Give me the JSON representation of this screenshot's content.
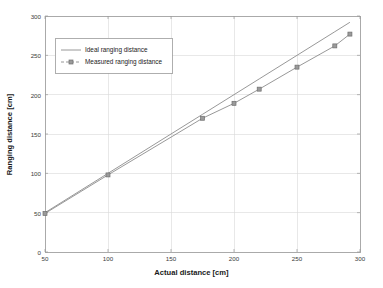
{
  "chart_data": {
    "type": "line",
    "title": "",
    "xlabel": "Actual distance [cm]",
    "ylabel": "Ranging distance [cm]",
    "xlim": [
      50,
      300
    ],
    "ylim": [
      0,
      300
    ],
    "xticks": [
      50,
      100,
      150,
      200,
      250,
      300
    ],
    "yticks": [
      0,
      50,
      100,
      150,
      200,
      250,
      300
    ],
    "grid": true,
    "legend_position": "upper-left-inside",
    "x": [
      50,
      100,
      175,
      200,
      220,
      250,
      280,
      292
    ],
    "series": [
      {
        "name": "Ideal ranging distance",
        "marker": "none",
        "color": "#8c8c8c",
        "values": [
          50,
          100,
          175,
          200,
          220,
          250,
          280,
          292
        ]
      },
      {
        "name": "Measured ranging distance",
        "marker": "square",
        "color": "#8c8c8c",
        "values": [
          49,
          98,
          170,
          189,
          207,
          235,
          262,
          277
        ]
      }
    ]
  },
  "axes": {
    "xlabel": "Actual distance [cm]",
    "ylabel": "Ranging distance [cm]",
    "xtick_labels": [
      "50",
      "100",
      "150",
      "200",
      "250",
      "300"
    ],
    "ytick_labels": [
      "0",
      "50",
      "100",
      "150",
      "200",
      "250",
      "300"
    ]
  },
  "legend": {
    "entries": [
      {
        "label": "Ideal ranging distance",
        "marker": "line"
      },
      {
        "label": "Measured ranging distance",
        "marker": "circle-line"
      }
    ]
  },
  "colors": {
    "line": "#8c8c8c",
    "grid": "#d8d8d8",
    "axis": "#9a9a9a",
    "text": "#1a1a1a",
    "background": "#ffffff"
  }
}
